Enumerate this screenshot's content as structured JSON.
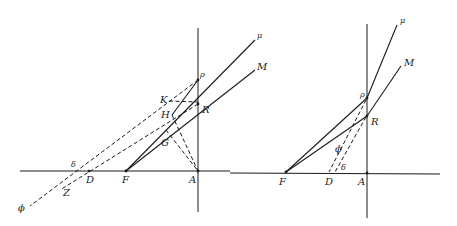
{
  "figure": {
    "left": {
      "labels": {
        "mu": "μ",
        "M": "M",
        "rho": "ρ",
        "K": "K",
        "R": "R",
        "H": "H",
        "G": "G",
        "delta": "δ",
        "D": "D",
        "F": "F",
        "A": "A",
        "Z": "Z",
        "phi": "ϕ"
      }
    },
    "right": {
      "labels": {
        "mu": "μ",
        "M": "M",
        "rho": "ρ",
        "R": "R",
        "phi": "ϕ",
        "delta": "δ",
        "F": "F",
        "D": "D",
        "A": "A"
      }
    }
  }
}
